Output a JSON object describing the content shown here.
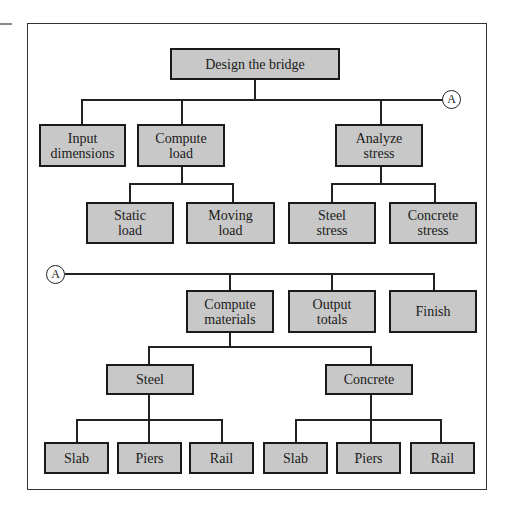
{
  "diagram": {
    "type": "structure chart",
    "root": "Design the bridge",
    "connector_label": "A",
    "level1": {
      "input_dimensions": "Input\ndimensions",
      "compute_load": "Compute\nload",
      "analyze_stress": "Analyze\nstress"
    },
    "load_children": {
      "static_load": "Static\nload",
      "moving_load": "Moving\nload"
    },
    "stress_children": {
      "steel_stress": "Steel\nstress",
      "concrete_stress": "Concrete\nstress"
    },
    "continuation": {
      "compute_materials": "Compute\nmaterials",
      "output_totals": "Output\ntotals",
      "finish": "Finish"
    },
    "materials_children": {
      "steel": "Steel",
      "concrete": "Concrete"
    },
    "steel_children": [
      "Slab",
      "Piers",
      "Rail"
    ],
    "concrete_children": [
      "Slab",
      "Piers",
      "Rail"
    ],
    "colors": {
      "node_fill": "#c8c8c8",
      "node_border": "#1a1a1a",
      "line": "#222222",
      "background": "#ffffff"
    }
  }
}
